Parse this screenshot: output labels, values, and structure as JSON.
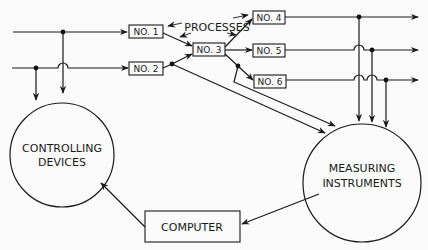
{
  "diagram": {
    "title_label": "PROCESSES",
    "processes": [
      {
        "id": "no1",
        "label": "NO. 1"
      },
      {
        "id": "no2",
        "label": "NO. 2"
      },
      {
        "id": "no3",
        "label": "NO. 3"
      },
      {
        "id": "no4",
        "label": "NO. 4"
      },
      {
        "id": "no5",
        "label": "NO. 5"
      },
      {
        "id": "no6",
        "label": "NO. 6"
      }
    ],
    "controlling_devices": {
      "line1": "CONTROLLING",
      "line2": "DEVICES"
    },
    "measuring_instruments": {
      "line1": "MEASURING",
      "line2": "INSTRUMENTS"
    },
    "computer": {
      "label": "COMPUTER"
    },
    "edges": [
      {
        "from": "input-1",
        "to": "no1"
      },
      {
        "from": "input-2",
        "to": "no2"
      },
      {
        "from": "no1",
        "to": "no3"
      },
      {
        "from": "no2",
        "to": "no3"
      },
      {
        "from": "no3",
        "to": "no4"
      },
      {
        "from": "no3",
        "to": "no5"
      },
      {
        "from": "no3",
        "to": "no6"
      },
      {
        "from": "no4",
        "to": "output-4"
      },
      {
        "from": "no5",
        "to": "output-5"
      },
      {
        "from": "no6",
        "to": "output-6"
      },
      {
        "from": "input-1",
        "to": "controlling_devices"
      },
      {
        "from": "input-2",
        "to": "controlling_devices"
      },
      {
        "from": "no2",
        "to": "measuring_instruments"
      },
      {
        "from": "no3",
        "to": "measuring_instruments"
      },
      {
        "from": "output-4",
        "to": "measuring_instruments"
      },
      {
        "from": "output-5",
        "to": "measuring_instruments"
      },
      {
        "from": "output-6",
        "to": "measuring_instruments"
      },
      {
        "from": "measuring_instruments",
        "to": "computer"
      },
      {
        "from": "computer",
        "to": "controlling_devices"
      }
    ],
    "colors": {
      "stroke": "#1a1a1a",
      "background": "#fbfbfb"
    }
  }
}
